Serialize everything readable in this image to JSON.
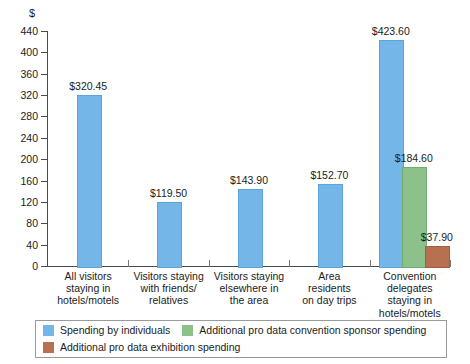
{
  "chart_data": {
    "type": "bar",
    "title": "",
    "xlabel": "",
    "ylabel": "$",
    "ylim": [
      0,
      440
    ],
    "ytick_step": 40,
    "grid": false,
    "legend_position": "bottom",
    "yticks": [
      "0",
      "40",
      "80",
      "120",
      "160",
      "200",
      "240",
      "280",
      "320",
      "360",
      "400",
      "440"
    ],
    "categories": [
      "All visitors staying in hotels/motels",
      "Visitors staying with friends/ relatives",
      "Visitors staying elsewhere in the area",
      "Area residents on day trips",
      "Convention delegates staying in hotels/motels"
    ],
    "category_lines": [
      [
        "All visitors",
        "staying in",
        "hotels/motels"
      ],
      [
        "Visitors staying",
        "with friends/",
        "relatives"
      ],
      [
        "Visitors staying",
        "elsewhere in",
        "the area"
      ],
      [
        "Area",
        "residents",
        "on day trips"
      ],
      [
        "Convention",
        "delegates",
        "staying in",
        "hotels/motels"
      ]
    ],
    "series": [
      {
        "name": "Spending by individuals",
        "color": "#74b6e8",
        "values": [
          320.45,
          119.5,
          143.9,
          152.7,
          423.6
        ],
        "labels": [
          "$320.45",
          "$119.50",
          "$143.90",
          "$152.70",
          "$423.60"
        ]
      },
      {
        "name": "Additional pro data convention sponsor spending",
        "color": "#8cc18a",
        "values": [
          null,
          null,
          null,
          null,
          184.6
        ],
        "labels": [
          "",
          "",
          "",
          "",
          "$184.60"
        ]
      },
      {
        "name": "Additional pro data exhibition spending",
        "color": "#b87150",
        "values": [
          null,
          null,
          null,
          null,
          37.9
        ],
        "labels": [
          "",
          "",
          "",
          "",
          "$37.90"
        ]
      }
    ]
  },
  "axis": {
    "currency_symbol": "$"
  },
  "legend": {
    "items": [
      {
        "label": "Spending by individuals",
        "color": "#74b6e8"
      },
      {
        "label": "Additional pro data convention sponsor spending",
        "color": "#8cc18a"
      },
      {
        "label": "Additional pro data exhibition spending",
        "color": "#b87150"
      }
    ]
  }
}
